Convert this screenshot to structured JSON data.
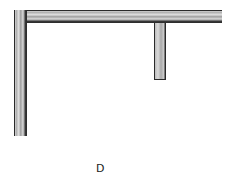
{
  "diagram": {
    "type": "wall-section-plan",
    "colors": {
      "wall_outline": "#2a2a2a",
      "wall_fill": "#bdbdbd",
      "background": "#ffffff"
    },
    "elements": [
      {
        "id": "top-wall",
        "orientation": "horizontal"
      },
      {
        "id": "left-wall",
        "orientation": "vertical"
      },
      {
        "id": "partition-stub",
        "orientation": "vertical"
      }
    ],
    "label": "D"
  }
}
